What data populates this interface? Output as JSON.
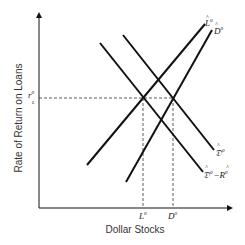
{
  "diagram": {
    "y_axis_label": "Rate of Return on Loans",
    "x_axis_label": "Dollar Stocks",
    "y_tick": {
      "base": "r",
      "sup": "0",
      "sub": "L"
    },
    "x_ticks": [
      {
        "base": "L",
        "sup": "0"
      },
      {
        "base": "D",
        "sup": "0"
      }
    ],
    "curves": [
      {
        "id": "L-hat-0",
        "label_base": "L",
        "label_sup": "0",
        "hat": true,
        "slope": "upward"
      },
      {
        "id": "D-hat-0",
        "label_base": "D",
        "label_sup": "0",
        "hat": true,
        "slope": "upward"
      },
      {
        "id": "Dfrak-hat-0",
        "label_base": "𝔇",
        "label_sup": "0",
        "hat": true,
        "slope": "downward"
      },
      {
        "id": "Dfrak-hat-0-minus-R-hat-0",
        "label_base": "𝔇",
        "label_sup": "0",
        "minus": "−",
        "label2_base": "R",
        "label2_sup": "0",
        "hat": true,
        "slope": "downward"
      }
    ],
    "colors": {
      "line": "#111111",
      "dash": "#333333",
      "text": "#222222"
    }
  }
}
